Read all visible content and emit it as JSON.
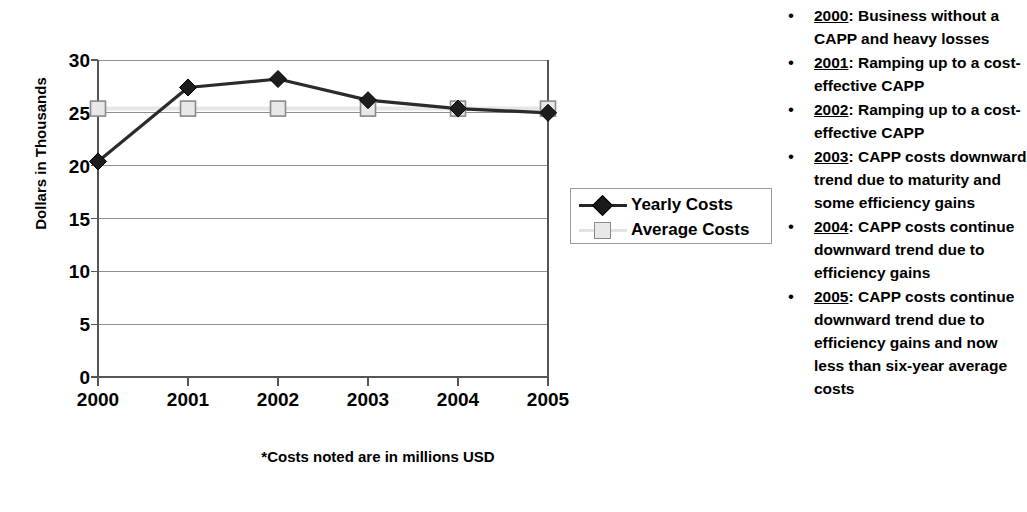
{
  "chart_data": {
    "type": "line",
    "title": "",
    "xlabel": "",
    "ylabel": "Dollars in Thousands",
    "categories": [
      "2000",
      "2001",
      "2002",
      "2003",
      "2004",
      "2005"
    ],
    "ylim": [
      0,
      30
    ],
    "ytick_step": 5,
    "yticks": [
      "0",
      "5",
      "10",
      "15",
      "20",
      "25",
      "30"
    ],
    "grid": true,
    "legend_position": "right-middle",
    "footnote": "*Costs noted are in millions USD",
    "series": [
      {
        "name": "Yearly Costs",
        "marker": "diamond",
        "color": "#222222",
        "values": [
          20.4,
          27.4,
          28.2,
          26.2,
          25.4,
          25.0
        ]
      },
      {
        "name": "Average Costs",
        "marker": "square",
        "color": "#e8e8e8",
        "values": [
          25.4,
          25.4,
          25.4,
          25.4,
          25.4,
          25.4
        ]
      }
    ]
  },
  "legend": {
    "items": [
      {
        "label": "Yearly Costs",
        "marker": "diamond-marker-icon"
      },
      {
        "label": "Average Costs",
        "marker": "square-marker-icon"
      }
    ]
  },
  "notes": {
    "bullet": "•",
    "items": [
      {
        "year": "2000",
        "separator": ": ",
        "text": "Business without a CAPP and heavy losses"
      },
      {
        "year": "2001",
        "separator": ": ",
        "text": "Ramping up to a cost-effective CAPP"
      },
      {
        "year": "2002",
        "separator": ": ",
        "text": "Ramping up to a cost-effective CAPP"
      },
      {
        "year": "2003",
        "separator": ": ",
        "text": "CAPP costs downward trend due to maturity and some efficiency gains"
      },
      {
        "year": "2004",
        "separator": ": ",
        "text": "CAPP costs continue downward trend due to efficiency gains"
      },
      {
        "year": "2005",
        "separator": ": ",
        "text": "CAPP costs continue downward trend due to efficiency gains and now less than six-year average costs"
      }
    ]
  }
}
